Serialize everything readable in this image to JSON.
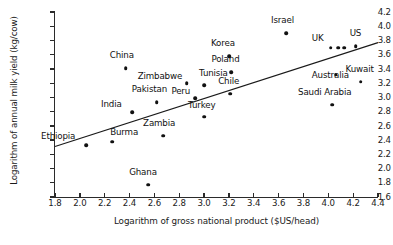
{
  "chart_data": {
    "type": "scatter",
    "title": "",
    "xlabel": "Logarithm of gross national product ($US/head)",
    "ylabel": "Logarithm of annual milk yield (kg/cow)",
    "xlim": [
      1.8,
      4.4
    ],
    "ylim": [
      1.6,
      4.2
    ],
    "xticks": [
      "1.8",
      "2.0",
      "2.2",
      "2.4",
      "2.6",
      "2.8",
      "3.0",
      "3.2",
      "3.4",
      "3.6",
      "3.8",
      "4.0",
      "4.2",
      "4.4"
    ],
    "yticks": [
      "1.6",
      "1.8",
      "2.0",
      "2.2",
      "2.4",
      "2.6",
      "2.8",
      "3.0",
      "3.2",
      "3.4",
      "3.6",
      "3.8",
      "4.0",
      "4.2"
    ],
    "grid": false,
    "legend": "none",
    "trendline": {
      "x0": 1.8,
      "y0": 2.31,
      "x1": 4.4,
      "y1": 3.77
    },
    "points": [
      {
        "label": "Ethiopia",
        "x": 2.05,
        "y": 2.33,
        "lx": -45,
        "ly": -5
      },
      {
        "label": "Burma",
        "x": 2.26,
        "y": 2.38,
        "lx": -2,
        "ly": -6
      },
      {
        "label": "Ghana",
        "x": 2.55,
        "y": 1.77,
        "lx": -19,
        "ly": -9
      },
      {
        "label": "Zambia",
        "x": 2.67,
        "y": 2.46,
        "lx": -20,
        "ly": -9
      },
      {
        "label": "India",
        "x": 2.42,
        "y": 2.79,
        "lx": -31,
        "ly": -4
      },
      {
        "label": "Pakistan",
        "x": 2.62,
        "y": 2.93,
        "lx": -25,
        "ly": -9
      },
      {
        "label": "China",
        "x": 2.37,
        "y": 3.41,
        "lx": -16,
        "ly": -9
      },
      {
        "label": "Zimbabwe",
        "x": 2.86,
        "y": 3.2,
        "lx": -49,
        "ly": -3
      },
      {
        "label": "Peru",
        "x": 2.93,
        "y": 2.99,
        "lx": -24,
        "ly": -3
      },
      {
        "label": "Turkey",
        "x": 3.0,
        "y": 2.73,
        "lx": -16,
        "ly": -8
      },
      {
        "label": "Tunisia",
        "x": 3.0,
        "y": 3.17,
        "lx": -5,
        "ly": -8
      },
      {
        "label": "Chile",
        "x": 3.21,
        "y": 3.05,
        "lx": -12,
        "ly": -9
      },
      {
        "label": "Poland",
        "x": 3.22,
        "y": 3.35,
        "lx": -20,
        "ly": -9
      },
      {
        "label": "Korea",
        "x": 3.2,
        "y": 3.58,
        "lx": -18,
        "ly": -9
      },
      {
        "label": "Israel",
        "x": 3.66,
        "y": 3.9,
        "lx": -15,
        "ly": -9
      },
      {
        "label": "UK",
        "x": 4.02,
        "y": 3.7,
        "lx": -19,
        "ly": -6
      },
      {
        "label": "",
        "x": 4.08,
        "y": 3.7,
        "lx": 0,
        "ly": 0
      },
      {
        "label": "",
        "x": 4.13,
        "y": 3.7,
        "lx": 0,
        "ly": 0
      },
      {
        "label": "US",
        "x": 4.22,
        "y": 3.72,
        "lx": -6,
        "ly": -9
      },
      {
        "label": "Australia",
        "x": 4.06,
        "y": 3.32,
        "lx": -24,
        "ly": 4
      },
      {
        "label": "Kuwait",
        "x": 4.26,
        "y": 3.22,
        "lx": -15,
        "ly": -9
      },
      {
        "label": "Saudi Arabia",
        "x": 4.03,
        "y": 2.9,
        "lx": -34,
        "ly": -9
      }
    ]
  }
}
